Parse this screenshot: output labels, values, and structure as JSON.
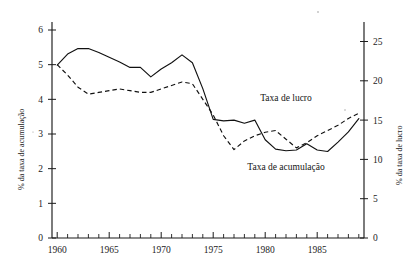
{
  "chart_data": {
    "type": "line",
    "title": "",
    "subtitle": "",
    "xlabel": "",
    "ylabel": "% da taxa de acumulação",
    "y2label": "% da taxa de lucro",
    "grid": false,
    "legend_position": "inline-annotations",
    "xlim": [
      1959.5,
      1989.5
    ],
    "ylim": [
      0,
      6.4
    ],
    "y2lim": [
      0,
      26.7
    ],
    "x_tick_labels": [
      "1960",
      "1965",
      "1970",
      "1975",
      "1980",
      "1985"
    ],
    "x_tick_values": [
      1960,
      1965,
      1970,
      1975,
      1980,
      1985
    ],
    "x_minor_ticks_every": 1,
    "y_tick_labels": [
      "0",
      "1",
      "2",
      "3",
      "4",
      "5",
      "6"
    ],
    "y_tick_values": [
      0,
      1,
      2,
      3,
      4,
      5,
      6
    ],
    "y2_tick_labels": [
      "0",
      "5",
      "10",
      "15",
      "20",
      "25"
    ],
    "y2_tick_values": [
      0,
      5,
      10,
      15,
      20,
      25
    ],
    "x": [
      1960,
      1961,
      1962,
      1963,
      1964,
      1965,
      1966,
      1967,
      1968,
      1969,
      1970,
      1971,
      1972,
      1973,
      1974,
      1975,
      1976,
      1977,
      1978,
      1979,
      1980,
      1981,
      1982,
      1983,
      1984,
      1985,
      1986,
      1987,
      1988,
      1989
    ],
    "series": [
      {
        "name": "Taxa de lucro",
        "axis": "right",
        "style": "solid",
        "annotation": "Taxa de lucro",
        "values": [
          22.0,
          23.4,
          24.1,
          24.1,
          23.6,
          23.0,
          22.4,
          21.7,
          21.7,
          20.5,
          21.5,
          22.3,
          23.3,
          22.3,
          19.0,
          15.1,
          14.9,
          15.0,
          14.6,
          15.0,
          12.5,
          11.3,
          11.1,
          11.2,
          12.0,
          11.2,
          11.0,
          12.2,
          13.5,
          15.2
        ]
      },
      {
        "name": "Taxa de acumulação",
        "axis": "left",
        "style": "dashed",
        "annotation": "Taxa de acumulação",
        "values": [
          5.0,
          4.7,
          4.35,
          4.15,
          4.2,
          4.25,
          4.3,
          4.25,
          4.2,
          4.2,
          4.3,
          4.4,
          4.5,
          4.45,
          4.0,
          3.55,
          2.95,
          2.55,
          2.8,
          2.95,
          3.05,
          3.1,
          2.85,
          2.6,
          2.75,
          2.95,
          3.1,
          3.25,
          3.45,
          3.6
        ]
      }
    ],
    "annotations": [
      {
        "text": "Taxa de lucro",
        "x": 1982.0,
        "y_axis": "right",
        "y": 17.4
      },
      {
        "text": "Taxa de acumulação",
        "x": 1982.0,
        "y_axis": "right",
        "y": 8.6
      }
    ]
  },
  "axes": {
    "left_title": "% da taxa de acumulação",
    "right_title": "% da taxa de lucro"
  }
}
